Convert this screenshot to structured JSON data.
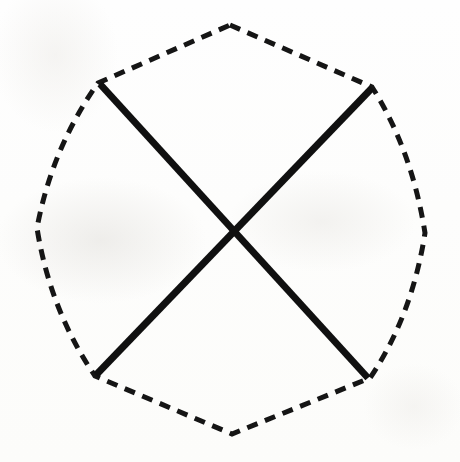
{
  "figure": {
    "canvas": {
      "width": 460,
      "height": 462
    },
    "background_color": "#fdfdfc",
    "ink_color": "#111111",
    "dashed_outline": {
      "name": "hexagon-dashed-outline",
      "stroke_color": "#151515",
      "stroke_width": 5,
      "dash_length": 11,
      "gap_length": 8,
      "closed": true,
      "vertex_count": 6,
      "vertices": [
        {
          "label": "top-apex",
          "x": 230,
          "y": 25
        },
        {
          "label": "upper-right",
          "x": 372,
          "y": 87
        },
        {
          "label": "right",
          "x": 425,
          "y": 233
        },
        {
          "label": "lower-right",
          "x": 370,
          "y": 378
        },
        {
          "label": "bottom-apex",
          "x": 232,
          "y": 434
        },
        {
          "label": "lower-left",
          "x": 95,
          "y": 376
        },
        {
          "label": "left",
          "x": 37,
          "y": 228
        },
        {
          "label": "upper-left",
          "x": 98,
          "y": 83
        }
      ],
      "path": "M 230 25 L 372 87 Q 412 150 425 233 Q 412 316 370 378 L 232 434 L 95 376 Q 50 310 37 228 Q 52 148 98 83 Z"
    },
    "solid_lines": [
      {
        "name": "diagonal-upper-left-to-lower-right",
        "stroke_color": "#101010",
        "stroke_width": 7,
        "x1": 100,
        "y1": 84,
        "x2": 368,
        "y2": 378
      },
      {
        "name": "diagonal-upper-right-to-lower-left",
        "stroke_color": "#101010",
        "stroke_width": 7,
        "x1": 372,
        "y1": 88,
        "x2": 96,
        "y2": 375
      }
    ],
    "intersection": {
      "name": "x-crossing-point",
      "x": 231,
      "y": 232
    }
  }
}
